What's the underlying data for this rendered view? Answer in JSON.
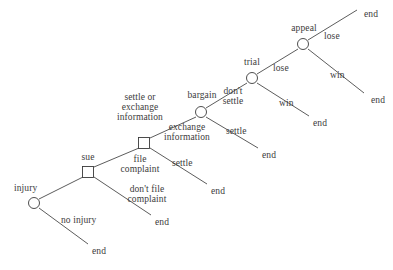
{
  "diagram": {
    "type": "extensive-form-game-tree",
    "background_color": "#ffffff",
    "line_color": "#4a4a4a",
    "text_color": "#3b3b3b",
    "nodes": [
      {
        "id": "injury",
        "shape": "circle",
        "label": "injury",
        "x": 34,
        "y": 203
      },
      {
        "id": "sue",
        "shape": "square",
        "label": "sue",
        "x": 88,
        "y": 172
      },
      {
        "id": "file_complaint",
        "shape": "square",
        "label": "settle or\nexchange\ninformation",
        "x": 144,
        "y": 143
      },
      {
        "id": "bargain",
        "shape": "circle",
        "label": "bargain",
        "x": 201,
        "y": 112
      },
      {
        "id": "trial",
        "shape": "circle",
        "label": "trial",
        "x": 252,
        "y": 78
      },
      {
        "id": "appeal",
        "shape": "circle",
        "label": "appeal",
        "x": 303,
        "y": 44
      }
    ],
    "node_labels": {
      "injury": "injury",
      "sue": "sue",
      "settle_or_exchange_information": "settle or\nexchange\ninformation",
      "bargain": "bargain",
      "trial": "trial",
      "appeal": "appeal"
    },
    "edges": [
      {
        "id": "e1",
        "from": "injury",
        "to": "sue",
        "label": ""
      },
      {
        "id": "e2",
        "from": "injury",
        "to": "end_no_injury",
        "label": "no injury"
      },
      {
        "id": "e3",
        "from": "sue",
        "to": "file_complaint",
        "label": "file\ncomplaint"
      },
      {
        "id": "e4",
        "from": "sue",
        "to": "end_dont_file",
        "label": "don't file\ncomplaint"
      },
      {
        "id": "e5",
        "from": "file_complaint",
        "to": "bargain",
        "label": "exchange\ninformation"
      },
      {
        "id": "e6",
        "from": "file_complaint",
        "to": "end_settle_1",
        "label": "settle"
      },
      {
        "id": "e7",
        "from": "bargain",
        "to": "trial",
        "label": "don't\nsettle"
      },
      {
        "id": "e8",
        "from": "bargain",
        "to": "end_settle_2",
        "label": "settle"
      },
      {
        "id": "e9",
        "from": "trial",
        "to": "appeal",
        "label": "lose"
      },
      {
        "id": "e10",
        "from": "trial",
        "to": "end_win_trial",
        "label": "win"
      },
      {
        "id": "e11",
        "from": "appeal",
        "to": "end_lose_appeal",
        "label": "lose"
      },
      {
        "id": "e12",
        "from": "appeal",
        "to": "end_win_appeal",
        "label": "win"
      }
    ],
    "terminals": [
      {
        "id": "end_no_injury",
        "label": "end",
        "x": 92,
        "y": 251
      },
      {
        "id": "end_dont_file",
        "label": "end",
        "x": 155,
        "y": 222
      },
      {
        "id": "end_settle_1",
        "label": "end",
        "x": 211,
        "y": 191
      },
      {
        "id": "end_settle_2",
        "label": "end",
        "x": 262,
        "y": 155
      },
      {
        "id": "end_win_trial",
        "label": "end",
        "x": 313,
        "y": 123
      },
      {
        "id": "end_lose_appeal",
        "label": "end",
        "x": 364,
        "y": 14
      },
      {
        "id": "end_win_appeal",
        "label": "end",
        "x": 371,
        "y": 100
      }
    ],
    "edge_labels": {
      "no_injury": "no injury",
      "file_complaint": "file\ncomplaint",
      "dont_file_complaint": "don't file\ncomplaint",
      "exchange_information": "exchange\ninformation",
      "settle_1": "settle",
      "dont_settle": "don't\nsettle",
      "settle_2": "settle",
      "lose_trial": "lose",
      "win_trial": "win",
      "lose_appeal": "lose",
      "win_appeal": "win"
    },
    "terminal_label": "end"
  }
}
